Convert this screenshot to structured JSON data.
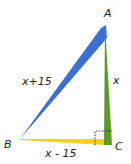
{
  "diagram": {
    "type": "right-triangle",
    "vertices": {
      "A": {
        "label": "A",
        "x": 105,
        "y": 23
      },
      "B": {
        "label": "B",
        "x": 20,
        "y": 139
      },
      "C": {
        "label": "C",
        "x": 112,
        "y": 145
      }
    },
    "sides": {
      "AB": {
        "label": "x+15",
        "color": "#3b6fd4"
      },
      "AC": {
        "label": "x",
        "color": "#5a9a2a"
      },
      "BC": {
        "label": "x - 15",
        "color": "#f2d21e"
      }
    },
    "right_angle_at": "C",
    "right_angle_marker": "dotted-square"
  }
}
